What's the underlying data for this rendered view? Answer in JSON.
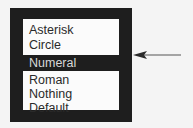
{
  "menu": {
    "items": [
      {
        "label": "Asterisk",
        "selected": false
      },
      {
        "label": "Circle",
        "selected": false
      },
      {
        "label": "Numeral",
        "selected": true
      },
      {
        "label": "Roman",
        "selected": false
      },
      {
        "label": "Nothing",
        "selected": false
      },
      {
        "label": "Default",
        "selected": false
      }
    ],
    "selected_index": 2
  },
  "annotation": {
    "icon": "arrow-left-icon",
    "points_to": "Numeral"
  },
  "colors": {
    "frame": "#1e1e1e",
    "list_background": "#fbfbfb",
    "text": "#2a2a2a",
    "selected_text": "#d8d8d8",
    "page_background": "#f4f4f4"
  }
}
